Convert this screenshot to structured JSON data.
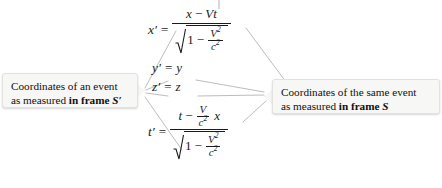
{
  "diagram": {
    "line_color": "#b9b9b9"
  },
  "callouts": {
    "left": {
      "line1": "Coordinates of an event",
      "line2_prefix": "as measured ",
      "line2_bold": "in frame ",
      "line2_symbol": "S′"
    },
    "right": {
      "line1": "Coordinates of the same event",
      "line2_prefix": "as measured ",
      "line2_bold": "in frame ",
      "line2_symbol": "S"
    }
  },
  "equations": {
    "x": {
      "lhs": "x′",
      "eq": "=",
      "numerator": {
        "a": "x",
        "op": "−",
        "b": "V",
        "c": "t"
      },
      "denominator": {
        "radicand_lead": "1",
        "op": "−",
        "frac_num": "V",
        "frac_num_exp": "2",
        "frac_den": "c",
        "frac_den_exp": "2"
      }
    },
    "y": {
      "lhs": "y′",
      "eq": "=",
      "rhs": "y"
    },
    "z": {
      "lhs": "z′",
      "eq": "=",
      "rhs": "z"
    },
    "t": {
      "lhs": "t′",
      "eq": "=",
      "numerator": {
        "a": "t",
        "op": "−",
        "frac_num": "V",
        "frac_den": "c",
        "frac_den_exp": "2",
        "trailing": "x"
      },
      "denominator": {
        "radicand_lead": "1",
        "op": "−",
        "frac_num": "V",
        "frac_num_exp": "2",
        "frac_den": "c",
        "frac_den_exp": "2"
      }
    }
  }
}
